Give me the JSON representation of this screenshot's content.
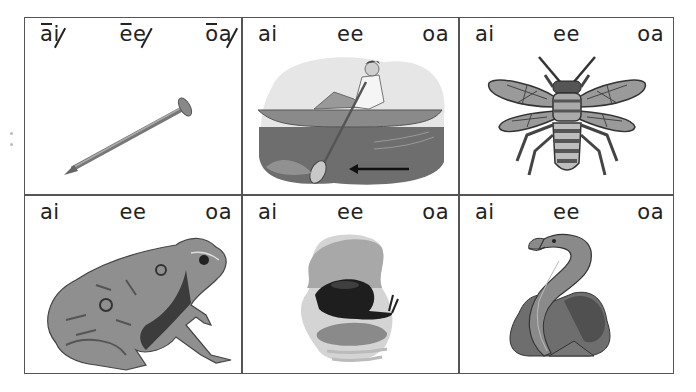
{
  "worksheet": {
    "cells": [
      {
        "picture": "nail",
        "choices": [
          {
            "text": "ai",
            "long_vowel": "a",
            "silent": "i"
          },
          {
            "text": "ee",
            "long_vowel": "e",
            "silent": "e"
          },
          {
            "text": "oa",
            "long_vowel": "o",
            "silent": "a"
          }
        ],
        "example": true
      },
      {
        "picture": "boat-rowing",
        "choices": [
          {
            "text": "ai"
          },
          {
            "text": "ee"
          },
          {
            "text": "oa"
          }
        ]
      },
      {
        "picture": "bee",
        "choices": [
          {
            "text": "ai"
          },
          {
            "text": "ee"
          },
          {
            "text": "oa"
          }
        ]
      },
      {
        "picture": "toad",
        "choices": [
          {
            "text": "ai"
          },
          {
            "text": "ee"
          },
          {
            "text": "oa"
          }
        ]
      },
      {
        "picture": "snail",
        "choices": [
          {
            "text": "ai"
          },
          {
            "text": "ee"
          },
          {
            "text": "oa"
          }
        ]
      },
      {
        "picture": "eel",
        "choices": [
          {
            "text": "ai"
          },
          {
            "text": "ee"
          },
          {
            "text": "oa"
          }
        ]
      }
    ]
  },
  "colors": {
    "border": "#555555",
    "text": "#222222",
    "art_dark": "#3a3a3a",
    "art_mid": "#7a7a7a",
    "art_light": "#c8c8c8"
  }
}
